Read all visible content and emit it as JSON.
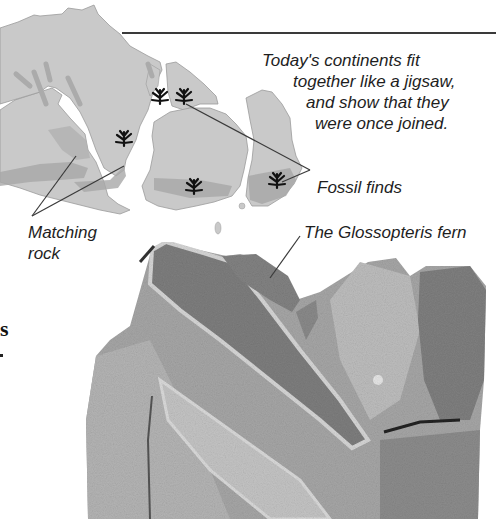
{
  "captions": {
    "main": {
      "line1": "Today's continents fit",
      "line2": "together like a jigsaw,",
      "line3": "and show that they",
      "line4": "were once joined."
    },
    "fossil_finds": "Fossil finds",
    "matching_rock": {
      "line1": "Matching",
      "line2": "rock"
    },
    "fern": "The Glossopteris fern"
  },
  "cut_off_text": {
    "heading_fragment": "s"
  },
  "colors": {
    "continent": "#c9c9c9",
    "continent_outline": "#9a9a9a",
    "matching_rock_band": "#a8a8a8",
    "fossil_marker": "#111111",
    "leader_line": "#3a3a3a",
    "fossil_slab": "#9c9c9c",
    "fern_leaf": "#7d7d7d"
  },
  "map": {
    "continents": [
      "South America",
      "Africa",
      "India",
      "Antarctica",
      "Australia"
    ],
    "fossil_markers": 6
  }
}
